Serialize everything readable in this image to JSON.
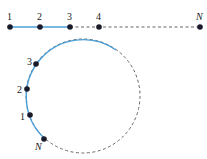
{
  "colors": {
    "solid": "#4a9fd8",
    "dashed": "#666666",
    "dot": "#1a1a2a"
  },
  "line": {
    "labels": [
      "1",
      "2",
      "3",
      "4",
      "N"
    ],
    "points_x": [
      10,
      40,
      70,
      99,
      200
    ],
    "y": 27
  },
  "circle": {
    "labels": [
      "3",
      "2",
      "1",
      "N"
    ],
    "center": [
      83,
      96
    ],
    "radius": 57
  }
}
